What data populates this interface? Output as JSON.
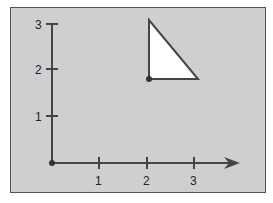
{
  "diagram": {
    "x_axis": {
      "ticks": [
        "1",
        "2",
        "3"
      ]
    },
    "y_axis": {
      "ticks": [
        "1",
        "2",
        "3"
      ]
    },
    "shape": {
      "type": "triangle",
      "vertices": [
        [
          2,
          3
        ],
        [
          2,
          1.8
        ],
        [
          3,
          1.8
        ]
      ],
      "marked_vertex": [
        2,
        1.8
      ]
    },
    "origin_marked": true,
    "colors": {
      "background": "#cfcfcf",
      "axis": "#444444",
      "triangle_fill": "#ffffff"
    }
  }
}
